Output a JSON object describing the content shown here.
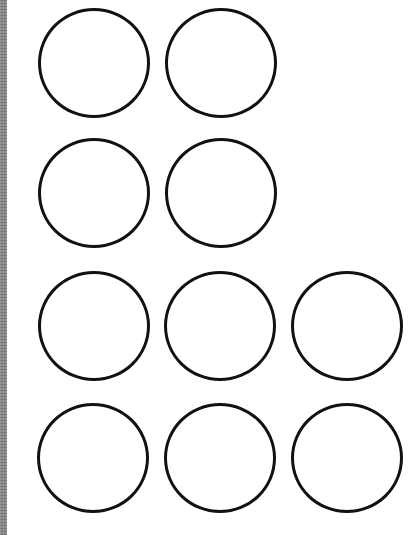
{
  "worksheet": {
    "rows": [
      {
        "count": 2,
        "top": 8,
        "circles": [
          {
            "left": 38
          },
          {
            "left": 165
          }
        ]
      },
      {
        "count": 2,
        "top": 138,
        "circles": [
          {
            "left": 38
          },
          {
            "left": 165
          }
        ]
      },
      {
        "count": 3,
        "top": 271,
        "circles": [
          {
            "left": 38
          },
          {
            "left": 164
          },
          {
            "left": 291
          }
        ]
      },
      {
        "count": 3,
        "top": 403,
        "circles": [
          {
            "left": 37
          },
          {
            "left": 164
          },
          {
            "left": 291
          }
        ]
      }
    ],
    "total_circles": 10,
    "circle_stroke_color": "#111111",
    "left_border_color": "#8a8a8a"
  }
}
